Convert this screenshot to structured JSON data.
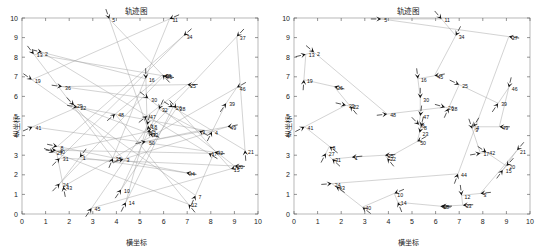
{
  "figure": {
    "panel_count": 2,
    "background": "#ffffff",
    "route_color": "#9d9d9d",
    "marker_color": "#111111",
    "frame_color": "#9a9a9a"
  },
  "chart_data": [
    {
      "type": "scatter",
      "panel": "left",
      "title": "轨迹图",
      "xlabel": "横坐标",
      "ylabel": "纵坐标",
      "xlim": [
        0,
        10
      ],
      "ylim": [
        0,
        10
      ],
      "xticks": [
        0,
        1,
        2,
        3,
        4,
        5,
        6,
        7,
        8,
        9,
        10
      ],
      "yticks": [
        0,
        1,
        2,
        3,
        4,
        5,
        6,
        7,
        8,
        9,
        10
      ],
      "grid": false,
      "legend": "none",
      "annotation": "初始随机路径（未优化）",
      "points": [
        {
          "id": "5",
          "x": 3.7,
          "y": 9.95
        },
        {
          "id": "11",
          "x": 6.25,
          "y": 9.95
        },
        {
          "id": "34",
          "x": 6.85,
          "y": 9.1
        },
        {
          "id": "37",
          "x": 9.1,
          "y": 9.05
        },
        {
          "id": "2",
          "x": 0.85,
          "y": 8.25
        },
        {
          "id": "13",
          "x": 0.5,
          "y": 8.15
        },
        {
          "id": "19",
          "x": 0.42,
          "y": 6.85
        },
        {
          "id": "36",
          "x": 1.7,
          "y": 6.5
        },
        {
          "id": "25",
          "x": 7.0,
          "y": 6.6
        },
        {
          "id": "46",
          "x": 9.1,
          "y": 6.45
        },
        {
          "id": "16",
          "x": 5.25,
          "y": 6.9
        },
        {
          "id": "45",
          "x": 6.0,
          "y": 7.05
        },
        {
          "id": "38",
          "x": 5.95,
          "y": 7.1
        },
        {
          "id": "29",
          "x": 2.2,
          "y": 5.55
        },
        {
          "id": "22",
          "x": 2.35,
          "y": 5.45
        },
        {
          "id": "30",
          "x": 5.35,
          "y": 5.9
        },
        {
          "id": "39",
          "x": 8.65,
          "y": 5.65
        },
        {
          "id": "26",
          "x": 6.4,
          "y": 5.45
        },
        {
          "id": "28",
          "x": 6.55,
          "y": 5.4
        },
        {
          "id": "32",
          "x": 5.8,
          "y": 5.35
        },
        {
          "id": "47",
          "x": 5.3,
          "y": 5.0
        },
        {
          "id": "48",
          "x": 3.95,
          "y": 5.1
        },
        {
          "id": "41",
          "x": 0.45,
          "y": 4.45
        },
        {
          "id": "9",
          "x": 7.5,
          "y": 4.25
        },
        {
          "id": "4",
          "x": 8.05,
          "y": 4.2
        },
        {
          "id": "49",
          "x": 8.7,
          "y": 4.45
        },
        {
          "id": "6",
          "x": 5.3,
          "y": 4.55
        },
        {
          "id": "18",
          "x": 5.35,
          "y": 4.5
        },
        {
          "id": "23",
          "x": 5.3,
          "y": 4.2
        },
        {
          "id": "33",
          "x": 5.4,
          "y": 4.1
        },
        {
          "id": "50",
          "x": 5.25,
          "y": 3.7
        },
        {
          "id": "8",
          "x": 1.5,
          "y": 3.45
        },
        {
          "id": "27",
          "x": 1.35,
          "y": 3.15
        },
        {
          "id": "40",
          "x": 1.45,
          "y": 3.25
        },
        {
          "id": "31",
          "x": 1.6,
          "y": 2.85
        },
        {
          "id": "21",
          "x": 9.45,
          "y": 3.25
        },
        {
          "id": "17",
          "x": 7.9,
          "y": 3.1
        },
        {
          "id": "42",
          "x": 8.15,
          "y": 3.15
        },
        {
          "id": "1",
          "x": 2.45,
          "y": 2.9
        },
        {
          "id": "35",
          "x": 3.85,
          "y": 2.85
        },
        {
          "id": "3",
          "x": 4.3,
          "y": 2.8
        },
        {
          "id": "20",
          "x": 9.0,
          "y": 2.45
        },
        {
          "id": "15",
          "x": 8.85,
          "y": 2.3
        },
        {
          "id": "44",
          "x": 6.95,
          "y": 2.1
        },
        {
          "id": "24",
          "x": 1.6,
          "y": 1.55
        },
        {
          "id": "43",
          "x": 1.75,
          "y": 1.4
        },
        {
          "id": "10",
          "x": 4.2,
          "y": 1.25
        },
        {
          "id": "7",
          "x": 7.35,
          "y": 0.95
        },
        {
          "id": "14",
          "x": 4.4,
          "y": 0.6
        },
        {
          "id": "12",
          "x": 7.05,
          "y": 0.5
        },
        {
          "id": "45b",
          "x": 2.95,
          "y": 0.3
        }
      ]
    },
    {
      "type": "scatter",
      "panel": "right",
      "title": "轨迹图",
      "xlabel": "横坐标",
      "ylabel": "纵坐标",
      "xlim": [
        0,
        10
      ],
      "ylim": [
        0,
        10
      ],
      "xticks": [
        0,
        1,
        2,
        3,
        4,
        5,
        6,
        7,
        8,
        9,
        10
      ],
      "yticks": [
        0,
        1,
        2,
        3,
        4,
        5,
        6,
        7,
        8,
        9,
        10
      ],
      "grid": false,
      "legend": "none",
      "annotation": "优化后路径",
      "points": [
        {
          "id": "5",
          "x": 3.7,
          "y": 9.95
        },
        {
          "id": "11",
          "x": 6.25,
          "y": 9.95
        },
        {
          "id": "34",
          "x": 6.85,
          "y": 9.1
        },
        {
          "id": "37",
          "x": 9.1,
          "y": 9.05
        },
        {
          "id": "2",
          "x": 0.85,
          "y": 8.25
        },
        {
          "id": "13",
          "x": 0.5,
          "y": 8.15
        },
        {
          "id": "19",
          "x": 0.42,
          "y": 6.85
        },
        {
          "id": "36",
          "x": 1.7,
          "y": 6.5
        },
        {
          "id": "16",
          "x": 5.25,
          "y": 6.9
        },
        {
          "id": "45",
          "x": 5.95,
          "y": 7.05
        },
        {
          "id": "25",
          "x": 7.0,
          "y": 6.6
        },
        {
          "id": "46",
          "x": 9.1,
          "y": 6.45
        },
        {
          "id": "39",
          "x": 8.65,
          "y": 5.65
        },
        {
          "id": "30",
          "x": 5.35,
          "y": 5.9
        },
        {
          "id": "26",
          "x": 6.4,
          "y": 5.45
        },
        {
          "id": "28",
          "x": 6.55,
          "y": 5.4
        },
        {
          "id": "48",
          "x": 3.95,
          "y": 5.1
        },
        {
          "id": "47",
          "x": 5.35,
          "y": 5.0
        },
        {
          "id": "49",
          "x": 8.7,
          "y": 4.45
        },
        {
          "id": "6",
          "x": 5.3,
          "y": 4.55
        },
        {
          "id": "8",
          "x": 5.38,
          "y": 4.45
        },
        {
          "id": "23",
          "x": 5.32,
          "y": 4.15
        },
        {
          "id": "41",
          "x": 0.45,
          "y": 4.45
        },
        {
          "id": "29",
          "x": 2.2,
          "y": 5.55
        },
        {
          "id": "22",
          "x": 2.38,
          "y": 5.5
        },
        {
          "id": "50",
          "x": 5.22,
          "y": 3.7
        },
        {
          "id": "9",
          "x": 7.55,
          "y": 4.35
        },
        {
          "id": "35",
          "x": 3.85,
          "y": 3.0
        },
        {
          "id": "32",
          "x": 3.95,
          "y": 2.85
        },
        {
          "id": "1",
          "x": 2.45,
          "y": 2.9
        },
        {
          "id": "17",
          "x": 7.9,
          "y": 3.1
        },
        {
          "id": "42",
          "x": 8.15,
          "y": 3.15
        },
        {
          "id": "21",
          "x": 9.45,
          "y": 3.25
        },
        {
          "id": "20",
          "x": 9.0,
          "y": 2.45
        },
        {
          "id": "15",
          "x": 8.85,
          "y": 2.25
        },
        {
          "id": "8b",
          "x": 1.5,
          "y": 3.45
        },
        {
          "id": "27",
          "x": 1.35,
          "y": 3.1
        },
        {
          "id": "31",
          "x": 1.62,
          "y": 2.8
        },
        {
          "id": "44",
          "x": 6.95,
          "y": 2.05
        },
        {
          "id": "24",
          "x": 1.6,
          "y": 1.55
        },
        {
          "id": "43",
          "x": 1.78,
          "y": 1.4
        },
        {
          "id": "10",
          "x": 4.25,
          "y": 1.05
        },
        {
          "id": "12",
          "x": 7.1,
          "y": 0.95
        },
        {
          "id": "3",
          "x": 7.9,
          "y": 1.05
        },
        {
          "id": "40",
          "x": 2.9,
          "y": 0.35
        },
        {
          "id": "14",
          "x": 4.4,
          "y": 0.6
        },
        {
          "id": "7",
          "x": 6.25,
          "y": 0.4
        },
        {
          "id": "33",
          "x": 7.15,
          "y": 0.45
        },
        {
          "id": "18",
          "x": 6.2,
          "y": 0.4
        },
        {
          "id": "4",
          "x": 7.6,
          "y": 4.45
        }
      ]
    }
  ]
}
